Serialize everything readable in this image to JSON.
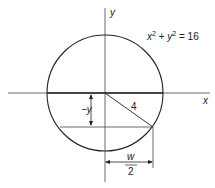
{
  "diagram": {
    "equation": {
      "x": "x",
      "sup1": "2",
      "plus": " + ",
      "y": "y",
      "sup2": "2",
      "eq": " = 16"
    },
    "axis_labels": {
      "x": "x",
      "y": "y"
    },
    "radius_label": "4",
    "height_label": "−y",
    "width_label_num": "w",
    "width_label_den": "2",
    "colors": {
      "stroke": "#222222",
      "background": "#ffffff"
    }
  }
}
